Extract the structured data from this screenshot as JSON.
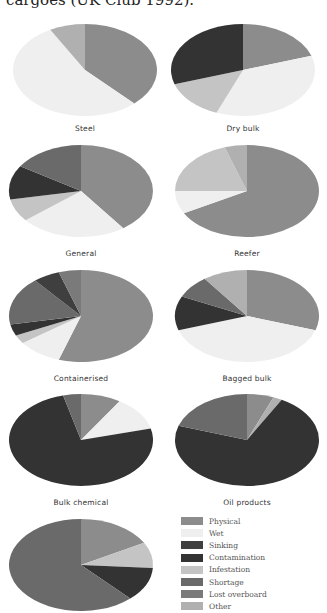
{
  "caption": "cargoes (UK Club 1992).",
  "legend": [
    {
      "key": "physical",
      "label": "Physical",
      "color": "#8c8c8c"
    },
    {
      "key": "wet",
      "label": "Wet",
      "color": "#efefef"
    },
    {
      "key": "sinking",
      "label": "Sinking",
      "color": "#3f3f3f"
    },
    {
      "key": "contamination",
      "label": "Contamination",
      "color": "#333333"
    },
    {
      "key": "infestation",
      "label": "Infestation",
      "color": "#c4c4c4"
    },
    {
      "key": "shortage",
      "label": "Shortage",
      "color": "#6a6a6a"
    },
    {
      "key": "lost_overboard",
      "label": "Lost overboard",
      "color": "#7a7a7a"
    },
    {
      "key": "other",
      "label": "Other",
      "color": "#b0b0b0"
    }
  ],
  "chart_data": [
    {
      "type": "pie",
      "title": "Steel",
      "categories": [
        "Physical",
        "Wet",
        "Other"
      ],
      "values": [
        38,
        54,
        8
      ]
    },
    {
      "type": "pie",
      "title": "Dry bulk",
      "categories": [
        "Physical",
        "Wet",
        "Infestation",
        "Contamination"
      ],
      "values": [
        20,
        36,
        14,
        30
      ]
    },
    {
      "type": "pie",
      "title": "General",
      "categories": [
        "Physical",
        "Wet",
        "Infestation",
        "Contamination",
        "Shortage"
      ],
      "values": [
        40,
        24,
        8,
        12,
        16
      ]
    },
    {
      "type": "pie",
      "title": "Reefer",
      "categories": [
        "Physical",
        "Wet",
        "Infestation",
        "Other"
      ],
      "values": [
        67,
        8,
        20,
        5
      ]
    },
    {
      "type": "pie",
      "title": "Containerised",
      "categories": [
        "Physical",
        "Wet",
        "Infestation",
        "Contamination",
        "Shortage",
        "Sinking",
        "Lost overboard"
      ],
      "values": [
        55,
        10,
        3,
        4,
        17,
        6,
        5
      ]
    },
    {
      "type": "pie",
      "title": "Bagged bulk",
      "categories": [
        "Physical",
        "Wet",
        "Contamination",
        "Shortage",
        "Other"
      ],
      "values": [
        30,
        40,
        12,
        8,
        10
      ]
    },
    {
      "type": "pie",
      "title": "Bulk chemical",
      "categories": [
        "Physical",
        "Wet",
        "Contamination",
        "Shortage"
      ],
      "values": [
        9,
        12,
        75,
        4
      ]
    },
    {
      "type": "pie",
      "title": "Oil products",
      "categories": [
        "Physical",
        "Other",
        "Contamination",
        "Shortage"
      ],
      "values": [
        6,
        2,
        72,
        20
      ]
    },
    {
      "type": "pie",
      "title": "",
      "categories": [
        "Physical",
        "Infestation",
        "Contamination",
        "Shortage"
      ],
      "values": [
        17,
        9,
        12,
        62
      ]
    }
  ],
  "pies": [
    {
      "x": 10,
      "y": 22,
      "label_y": 102
    },
    {
      "x": 168,
      "y": 22,
      "label_y": 102
    },
    {
      "x": 6,
      "y": 143,
      "label_y": 106
    },
    {
      "x": 172,
      "y": 143,
      "label_y": 106
    },
    {
      "x": 6,
      "y": 268,
      "label_y": 106
    },
    {
      "x": 172,
      "y": 268,
      "label_y": 106
    },
    {
      "x": 6,
      "y": 392,
      "label_y": 106
    },
    {
      "x": 172,
      "y": 392,
      "label_y": 106
    },
    {
      "x": 6,
      "y": 517,
      "label_y": 106
    }
  ]
}
